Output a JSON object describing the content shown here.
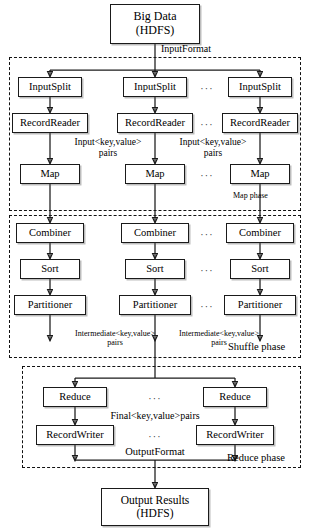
{
  "diagram": {
    "source": {
      "label_line1": "Big Data",
      "label_line2": "(HDFS)"
    },
    "sink": {
      "label_line1": "Output Results",
      "label_line2": "(HDFS)"
    },
    "edge_labels": {
      "input_format": "InputFormat",
      "input_kv_1": "Input<key,value>",
      "input_kv_1b": "pairs",
      "input_kv_2": "Input<key,value>",
      "input_kv_2b": "pairs",
      "intermediate_kv_1": "Intermediate<key,value>",
      "intermediate_kv_1b": "pairs",
      "intermediate_kv_2": "Intermediate<key,value>",
      "intermediate_kv_2b": "pairs",
      "final_kv": "Final<key,value>pairs",
      "output_format": "OutputFormat"
    },
    "phases": [
      {
        "name": "map",
        "label": "Map phase"
      },
      {
        "name": "shuffle",
        "label": "Shuffle phase"
      },
      {
        "name": "reduce",
        "label": "Reduce phase"
      }
    ],
    "ellipsis": "···",
    "rows": [
      {
        "name": "inputsplit",
        "label": "InputSplit",
        "columns": 3
      },
      {
        "name": "recordreader",
        "label": "RecordReader",
        "columns": 3
      },
      {
        "name": "map",
        "label": "Map",
        "columns": 3
      },
      {
        "name": "combiner",
        "label": "Combiner",
        "columns": 3
      },
      {
        "name": "sort",
        "label": "Sort",
        "columns": 3
      },
      {
        "name": "partitioner",
        "label": "Partitioner",
        "columns": 3
      },
      {
        "name": "reduce",
        "label": "Reduce",
        "columns": 2
      },
      {
        "name": "recordwriter",
        "label": "RecordWriter",
        "columns": 2
      }
    ],
    "nodes": {
      "inputsplit_1": "InputSplit",
      "inputsplit_2": "InputSplit",
      "inputsplit_3": "InputSplit",
      "recordreader_1": "RecordReader",
      "recordreader_2": "RecordReader",
      "recordreader_3": "RecordReader",
      "map_1": "Map",
      "map_2": "Map",
      "map_3": "Map",
      "combiner_1": "Combiner",
      "combiner_2": "Combiner",
      "combiner_3": "Combiner",
      "sort_1": "Sort",
      "sort_2": "Sort",
      "sort_3": "Sort",
      "partitioner_1": "Partitioner",
      "partitioner_2": "Partitioner",
      "partitioner_3": "Partitioner",
      "reduce_1": "Reduce",
      "reduce_2": "Reduce",
      "recordwriter_1": "RecordWriter",
      "recordwriter_2": "RecordWriter"
    },
    "colors": {
      "stroke": "#1a1a1a",
      "background": "#ffffff",
      "shadow": "rgba(90,90,90,0.40)"
    }
  }
}
